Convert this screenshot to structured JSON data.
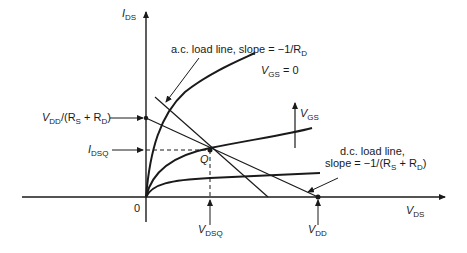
{
  "diagram": {
    "axes": {
      "y_label_main": "I",
      "y_label_sub": "DS",
      "x_label_main": "V",
      "x_label_sub": "DS",
      "origin": "0"
    },
    "annotations": {
      "ac_load_line": "a.c. load line, slope = −1/R",
      "ac_load_line_sub": "D",
      "vgs0_main": "V",
      "vgs0_sub": "GS",
      "vgs0_tail": " = 0",
      "vgs_arrow_main": "V",
      "vgs_arrow_sub": "GS",
      "dc_load_line_1": "d.c. load line,",
      "dc_load_line_2": "slope = −1/(R",
      "dc_load_line_2_s": "S",
      "dc_load_line_2_mid": " + R",
      "dc_load_line_2_d": "D",
      "dc_load_line_2_end": ")",
      "vdd_over_main": "V",
      "vdd_over_sub": "DD",
      "vdd_over_mid": "/(R",
      "vdd_over_s": "S",
      "vdd_over_plus": " + R",
      "vdd_over_d": "D",
      "vdd_over_end": ")",
      "idsq_main": "I",
      "idsq_sub": "DSQ",
      "q_point": "Q",
      "vdsq_main": "V",
      "vdsq_sub": "DSQ",
      "vdd_main": "V",
      "vdd_sub": "DD"
    },
    "colors": {
      "ink": "#1a1a1a",
      "background": "#ffffff"
    }
  }
}
